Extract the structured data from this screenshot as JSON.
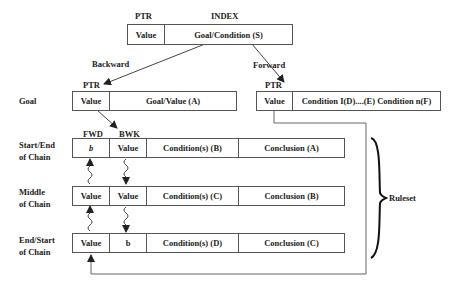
{
  "index": {
    "ptr_label": "PTR",
    "title": "INDEX",
    "value": "Value",
    "key": "Goal/Condition (S)"
  },
  "edges": {
    "backward": "Backward",
    "forward": "Forward"
  },
  "goal": {
    "side_label": "Goal",
    "ptr_label": "PTR",
    "value": "Value",
    "content": "Goal/Value (A)"
  },
  "forward_entry": {
    "ptr_label": "PTR",
    "value": "Value",
    "content": "Condition I(D)....(E) Condition n(F)"
  },
  "chain": {
    "fwd_label": "FWD",
    "bwk_label": "BWK",
    "rows": [
      {
        "side_line1": "Start/End",
        "side_line2": "of Chain",
        "fwd": "b",
        "bwk": "Value",
        "conditions": "Condition(s) (B)",
        "conclusion": "Conclusion (A)"
      },
      {
        "side_line1": "Middle",
        "side_line2": "of Chain",
        "fwd": "Value",
        "bwk": "Value",
        "conditions": "Condition(s) (C)",
        "conclusion": "Conclusion (B)"
      },
      {
        "side_line1": "End/Start",
        "side_line2": "of Chain",
        "fwd": "Value",
        "bwk": "b",
        "conditions": "Condition(s) (D)",
        "conclusion": "Conclusion (C)"
      }
    ]
  },
  "ruleset_label": "Ruleset"
}
